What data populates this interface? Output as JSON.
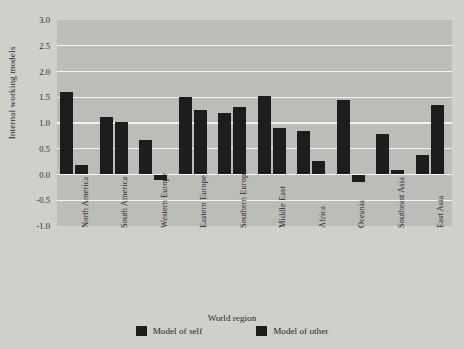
{
  "chart_data": {
    "type": "bar",
    "title": "",
    "xlabel": "World region",
    "ylabel": "Internal working models",
    "ylim": [
      -1.0,
      3.0
    ],
    "yticks": [
      "3.0",
      "2.5",
      "2.0",
      "1.5",
      "1.0",
      "0.5",
      "0.0",
      "-0.5",
      "-1.0"
    ],
    "ytick_values": [
      3.0,
      2.5,
      2.0,
      1.5,
      1.0,
      0.5,
      0.0,
      -0.5,
      -1.0
    ],
    "grid": true,
    "legend_position": "bottom",
    "categories": [
      "North America",
      "South America",
      "Western Europe",
      "Eastern Europe",
      "Southern Europe",
      "Middle East",
      "Africa",
      "Oceania",
      "Southeast Asia",
      "East Asia"
    ],
    "series": [
      {
        "name": "Model of self",
        "values": [
          1.6,
          1.11,
          0.67,
          1.51,
          1.2,
          1.52,
          0.85,
          1.45,
          0.78,
          0.38
        ]
      },
      {
        "name": "Model of other",
        "values": [
          0.18,
          1.02,
          -0.1,
          1.26,
          1.31,
          0.9,
          0.27,
          -0.15,
          0.08,
          1.35
        ]
      }
    ]
  },
  "legend": {
    "items": [
      {
        "label": "Model of self"
      },
      {
        "label": "Model of other"
      }
    ]
  },
  "colors": {
    "bar": "#1d1d1d",
    "plot_background": "#bcbcb8",
    "figure_background": "#cfcfcb",
    "gridline": "#f4f4f2"
  }
}
